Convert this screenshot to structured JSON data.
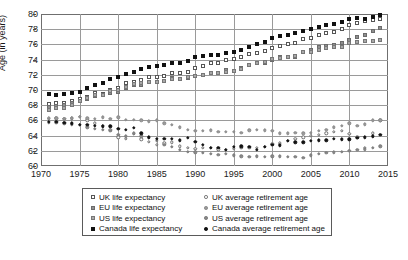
{
  "chart_data": {
    "type": "scatter",
    "title": "",
    "xlabel": "",
    "ylabel": "Age (in years)",
    "xlim": [
      1970,
      2015
    ],
    "ylim": [
      60,
      80
    ],
    "xticks": [
      1970,
      1975,
      1980,
      1985,
      1990,
      1995,
      2000,
      2005,
      2010,
      2015
    ],
    "yticks": [
      60,
      62,
      64,
      66,
      68,
      70,
      72,
      74,
      76,
      78,
      80
    ],
    "grid": true,
    "legend_position": "below-plot",
    "x": [
      1971,
      1972,
      1973,
      1974,
      1975,
      1976,
      1977,
      1978,
      1979,
      1980,
      1981,
      1982,
      1983,
      1984,
      1985,
      1986,
      1987,
      1988,
      1989,
      1990,
      1991,
      1992,
      1993,
      1994,
      1995,
      1996,
      1997,
      1998,
      1999,
      2000,
      2001,
      2002,
      2003,
      2004,
      2005,
      2006,
      2007,
      2008,
      2009,
      2010,
      2011,
      2012,
      2013,
      2014
    ],
    "series": [
      {
        "name": "UK life expectancy",
        "marker": "open-square",
        "color": "#ffffff",
        "edge_color": "#555555",
        "values": [
          68.1,
          68.3,
          68.3,
          68.6,
          68.8,
          69.1,
          69.6,
          69.5,
          70.0,
          70.3,
          70.9,
          71.1,
          71.3,
          71.7,
          71.7,
          71.9,
          72.3,
          72.2,
          72.4,
          72.9,
          73.2,
          73.6,
          73.6,
          74.0,
          74.1,
          74.3,
          74.7,
          74.9,
          75.1,
          75.5,
          75.8,
          76.0,
          76.2,
          76.7,
          76.9,
          77.3,
          77.5,
          77.6,
          78.0,
          78.5,
          78.8,
          79.1,
          79.2,
          79.3
        ]
      },
      {
        "name": "EU life expectancy",
        "marker": "gray-square",
        "color": "#8f8f8f",
        "edge_color": "#6b6b6b",
        "values": [
          67.8,
          67.9,
          68.0,
          68.3,
          68.5,
          68.8,
          69.2,
          69.3,
          69.6,
          69.8,
          70.3,
          70.6,
          70.6,
          71.0,
          71.0,
          71.2,
          71.6,
          71.5,
          71.6,
          71.9,
          72.0,
          72.2,
          72.2,
          72.6,
          72.5,
          72.9,
          73.3,
          73.5,
          73.6,
          74.0,
          74.3,
          74.4,
          74.4,
          75.0,
          75.2,
          75.6,
          75.8,
          75.9,
          76.2,
          76.6,
          77.0,
          77.3,
          77.8,
          78.1
        ]
      },
      {
        "name": "US life expectancy",
        "marker": "gray-square",
        "color": "#a8a8a8",
        "edge_color": "#777777",
        "values": [
          67.4,
          67.6,
          67.6,
          68.0,
          68.6,
          68.9,
          69.3,
          69.4,
          69.9,
          70.0,
          70.4,
          70.8,
          70.9,
          71.1,
          71.1,
          71.2,
          71.4,
          71.4,
          71.7,
          71.8,
          72.0,
          72.2,
          72.2,
          72.4,
          72.5,
          72.8,
          73.3,
          73.6,
          73.7,
          74.1,
          74.2,
          74.3,
          74.5,
          75.0,
          75.0,
          75.2,
          75.5,
          75.6,
          75.7,
          76.2,
          76.3,
          76.4,
          76.5,
          76.6
        ]
      },
      {
        "name": "Canada life expectancy",
        "marker": "filled-square",
        "color": "#111111",
        "edge_color": "#111111",
        "values": [
          69.5,
          69.4,
          69.5,
          69.6,
          69.8,
          70.2,
          70.6,
          70.9,
          71.5,
          71.7,
          72.1,
          72.4,
          72.7,
          73.0,
          73.1,
          73.3,
          73.5,
          73.6,
          73.8,
          74.3,
          74.5,
          74.6,
          74.6,
          74.9,
          75.0,
          75.3,
          75.6,
          76.0,
          76.3,
          76.8,
          77.1,
          77.3,
          77.5,
          77.8,
          78.0,
          78.3,
          78.5,
          78.7,
          79.0,
          79.3,
          79.5,
          79.3,
          79.6,
          79.9
        ]
      },
      {
        "name": "UK average retirement age",
        "marker": "open-circle",
        "color": "#ffffff",
        "edge_color": "#6a6a6a",
        "values": [
          66.3,
          66.3,
          66.2,
          66.3,
          66.5,
          66.0,
          65.6,
          65.3,
          64.8,
          63.8,
          63.6,
          64.2,
          63.5,
          63.2,
          62.8,
          63.0,
          63.1,
          62.6,
          62.4,
          62.3,
          62.4,
          62.4,
          62.2,
          62.1,
          62.3,
          62.4,
          62.4,
          62.4,
          62.5,
          62.9,
          63.0,
          63.3,
          63.6,
          63.8,
          64.0,
          64.1,
          64.3,
          64.5,
          64.6,
          64.2,
          63.8,
          62.4,
          64.3,
          66.0
        ]
      },
      {
        "name": "EU average retirement age",
        "marker": "gray-circle",
        "color": "#9b9b9b",
        "edge_color": "#8a8a8a",
        "values": [
          66.2,
          66.3,
          66.2,
          66.3,
          66.5,
          66.3,
          66.2,
          66.4,
          66.2,
          66.4,
          66.1,
          66.1,
          66.0,
          65.9,
          66.0,
          65.6,
          65.4,
          65.1,
          64.8,
          64.6,
          64.6,
          64.7,
          64.5,
          64.5,
          64.5,
          64.4,
          64.7,
          64.8,
          64.7,
          64.6,
          64.3,
          64.3,
          64.4,
          64.3,
          64.4,
          64.6,
          64.8,
          65.1,
          65.3,
          65.6,
          65.3,
          65.5,
          66.0,
          66.0
        ]
      },
      {
        "name": "US average retirement age",
        "marker": "gray-circle",
        "color": "#8a8a8a",
        "edge_color": "#7a7a7a",
        "values": [
          65.7,
          65.7,
          65.6,
          65.5,
          65.4,
          65.1,
          64.9,
          64.8,
          64.6,
          64.1,
          63.9,
          64.3,
          63.9,
          63.7,
          63.3,
          62.8,
          62.5,
          62.1,
          61.9,
          61.8,
          61.7,
          61.6,
          61.5,
          61.6,
          61.4,
          61.3,
          61.2,
          61.3,
          61.2,
          61.3,
          61.3,
          61.2,
          61.2,
          61.1,
          61.4,
          61.6,
          61.7,
          61.8,
          61.9,
          62.0,
          62.1,
          62.2,
          62.4,
          62.6
        ]
      },
      {
        "name": "Canada average retirement age",
        "marker": "filled-circle",
        "color": "#111111",
        "edge_color": "#111111",
        "values": [
          65.8,
          65.8,
          65.7,
          65.6,
          65.4,
          65.4,
          65.3,
          65.2,
          65.2,
          64.9,
          64.8,
          65.0,
          64.3,
          63.8,
          63.6,
          63.6,
          63.6,
          63.4,
          63.7,
          63.2,
          62.8,
          62.4,
          62.4,
          62.1,
          62.5,
          62.6,
          62.5,
          62.1,
          62.5,
          62.8,
          62.7,
          63.3,
          63.1,
          63.1,
          63.3,
          63.4,
          63.4,
          63.6,
          63.5,
          63.5,
          63.7,
          63.8,
          63.9,
          64.1
        ]
      }
    ]
  },
  "axis": {
    "ylabel": "Age (in years)",
    "yticks": [
      "80",
      "78",
      "76",
      "74",
      "72",
      "70",
      "68",
      "66",
      "64",
      "62",
      "60"
    ],
    "xticks": [
      "1970",
      "1975",
      "1980",
      "1985",
      "1990",
      "1995",
      "2000",
      "2005",
      "2010",
      "2015"
    ]
  },
  "legend": {
    "left_column": [
      {
        "label": "UK life expectancy",
        "marker": "open-square",
        "fill": "#ffffff",
        "edge": "#555555"
      },
      {
        "label": "EU life expectancy",
        "marker": "gray-square",
        "fill": "#8f8f8f",
        "edge": "#6b6b6b"
      },
      {
        "label": "US life expectancy",
        "marker": "gray-square",
        "fill": "#a8a8a8",
        "edge": "#777777"
      },
      {
        "label": "Canada life expectancy",
        "marker": "filled-square",
        "fill": "#111111",
        "edge": "#111111"
      }
    ],
    "right_column": [
      {
        "label": "UK average retirement age",
        "marker": "open-circle",
        "fill": "#ffffff",
        "edge": "#6a6a6a"
      },
      {
        "label": "EU average retirement age",
        "marker": "gray-circle",
        "fill": "#9b9b9b",
        "edge": "#8a8a8a"
      },
      {
        "label": "US average retirement age",
        "marker": "gray-circle",
        "fill": "#8a8a8a",
        "edge": "#7a7a7a"
      },
      {
        "label": "Canada average retirement age",
        "marker": "filled-circle",
        "fill": "#111111",
        "edge": "#111111"
      }
    ]
  }
}
